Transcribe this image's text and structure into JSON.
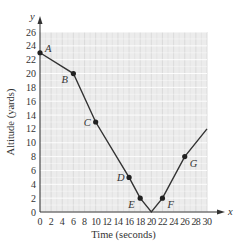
{
  "chart_data": {
    "type": "line",
    "title": "",
    "xlabel": "Time (seconds)",
    "ylabel": "Altitude (yards)",
    "x_axis_symbol": "x",
    "y_axis_symbol": "y",
    "xlim": [
      0,
      30
    ],
    "ylim": [
      0,
      26
    ],
    "x_ticks": [
      0,
      2,
      4,
      6,
      8,
      10,
      12,
      14,
      16,
      18,
      20,
      22,
      24,
      26,
      28,
      30
    ],
    "y_ticks": [
      0,
      2,
      4,
      6,
      8,
      10,
      12,
      14,
      16,
      18,
      20,
      22,
      24,
      26
    ],
    "grid": true,
    "series": [
      {
        "name": "Altitude",
        "x": [
          0,
          6,
          10,
          16,
          18,
          20,
          22,
          26,
          30
        ],
        "y": [
          23,
          20,
          13,
          5,
          2,
          0,
          2,
          8,
          12
        ]
      }
    ],
    "labeled_points": [
      {
        "label": "A",
        "x": 0,
        "y": 23
      },
      {
        "label": "B",
        "x": 6,
        "y": 20
      },
      {
        "label": "C",
        "x": 10,
        "y": 13
      },
      {
        "label": "D",
        "x": 16,
        "y": 5
      },
      {
        "label": "E",
        "x": 18,
        "y": 2
      },
      {
        "label": "F",
        "x": 22,
        "y": 2
      },
      {
        "label": "G",
        "x": 26,
        "y": 8
      }
    ],
    "colors": {
      "grid_bg": "#ececec",
      "grid_line": "#d6d6d6",
      "line": "#333333",
      "axis": "#333333"
    }
  }
}
